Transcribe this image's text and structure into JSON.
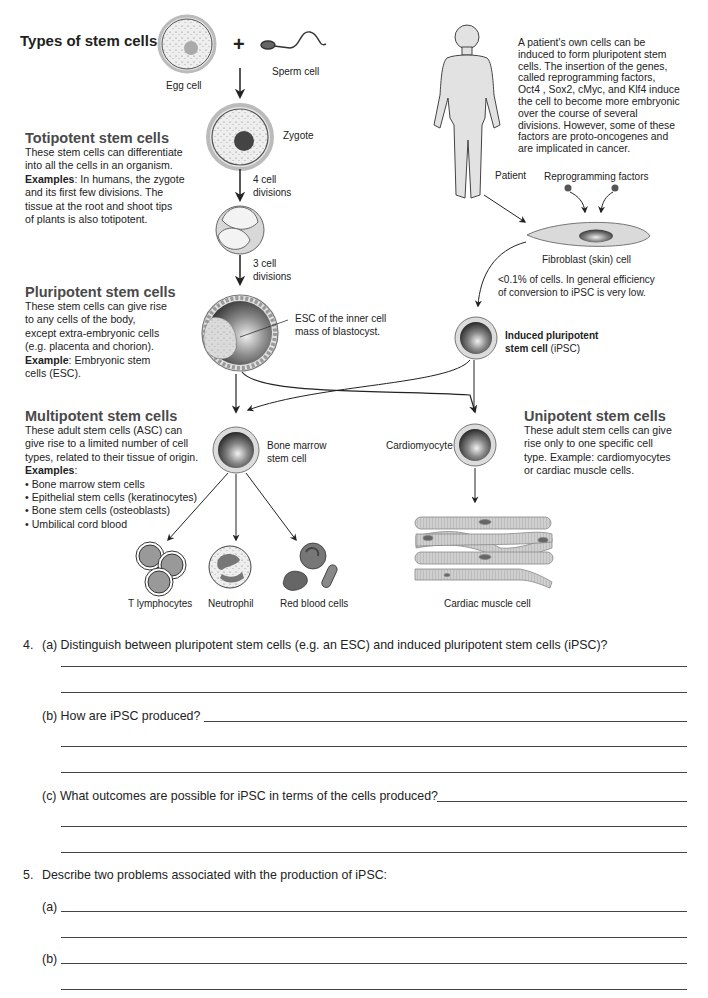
{
  "page_title": "Types of stem cells",
  "diagram": {
    "labels": {
      "egg_cell": "Egg cell",
      "sperm_cell": "Sperm cell",
      "plus": "+",
      "zygote": "Zygote",
      "four_cell_divisions": [
        "4 cell",
        "divisions"
      ],
      "three_cell_divisions": [
        "3 cell",
        "divisions"
      ],
      "esc_label": [
        "ESC of the inner cell",
        "mass of blastocyst."
      ],
      "bone_marrow_stem_cell": [
        "Bone marrow",
        "stem cell"
      ],
      "t_lymphocytes": "T lymphocytes",
      "neutrophil": "Neutrophil",
      "red_blood_cells": "Red blood cells",
      "patient": "Patient",
      "reprogramming_factors": "Reprogramming factors",
      "fibroblast": "Fibroblast (skin) cell",
      "efficiency_note": [
        "<0.1% of cells. In general efficiency",
        "of conversion to iPSC is very low."
      ],
      "ipsc_bold": [
        "Induced pluripotent",
        "stem cell"
      ],
      "ipsc_suffix": " (iPSC)",
      "cardiomyocyte": "Cardiomyocyte",
      "cardiac_muscle_cell": "Cardiac muscle cell"
    },
    "patient_text": [
      "A patient's own cells can be",
      "induced to form pluripotent stem",
      "cells. The insertion of the genes,",
      "called reprogramming factors,",
      "Oct4 , Sox2, cMyc, and Klf4 induce",
      "the cell to become more embryonic",
      "over the course of several",
      "divisions. However, some of these",
      "factors are proto-oncogenes and",
      "are implicated in cancer."
    ]
  },
  "sections": {
    "totipotent": {
      "heading": "Totipotent stem cells",
      "lines": [
        "These stem cells can differentiate",
        "into all the cells in an organism."
      ],
      "examples_label": "Examples",
      "examples_text": ": In humans, the zygote",
      "lines2": [
        "and its first few divisions. The",
        "tissue at the root and shoot tips",
        "of plants is also totipotent."
      ]
    },
    "pluripotent": {
      "heading": "Pluripotent stem cells",
      "lines": [
        "These stem cells can give rise",
        "to any cells of the body,",
        "except extra-embryonic cells",
        "(e.g. placenta and chorion)."
      ],
      "example_label": "Example",
      "example_text": ": Embryonic stem",
      "lines2": [
        "cells (ESC)."
      ]
    },
    "multipotent": {
      "heading": "Multipotent stem cells",
      "lines": [
        "These adult stem cells (ASC) can",
        "give rise to a limited number of cell",
        "types, related to their tissue of origin."
      ],
      "examples_label": "Examples",
      "examples_colon": ":",
      "bullets": [
        "Bone marrow stem cells",
        "Epithelial stem cells (keratinocytes)",
        "Bone stem cells (osteoblasts)",
        "Umbilical cord blood"
      ]
    },
    "unipotent": {
      "heading": "Unipotent stem cells",
      "lines": [
        "These adult stem cells can give",
        "rise only to one specific cell",
        "type. Example: cardiomyocytes",
        "or cardiac muscle cells."
      ]
    }
  },
  "questions": {
    "q4": {
      "number": "4.",
      "a": "(a) Distinguish between pluripotent stem cells (e.g. an ESC) and induced pluripotent stem cells (iPSC)?",
      "b": "(b) How are iPSC produced?",
      "c": "(c) What outcomes are possible for iPSC in terms of the cells produced?"
    },
    "q5": {
      "number": "5.",
      "text": "Describe two problems associated with the production of iPSC:",
      "a": "(a)",
      "b": "(b)"
    }
  },
  "colors": {
    "text": "#231f20",
    "heading_gray": "#4a4a4a",
    "cell_fill": "#d9d9d9",
    "nucleus_dark": "#3a3a3a"
  }
}
